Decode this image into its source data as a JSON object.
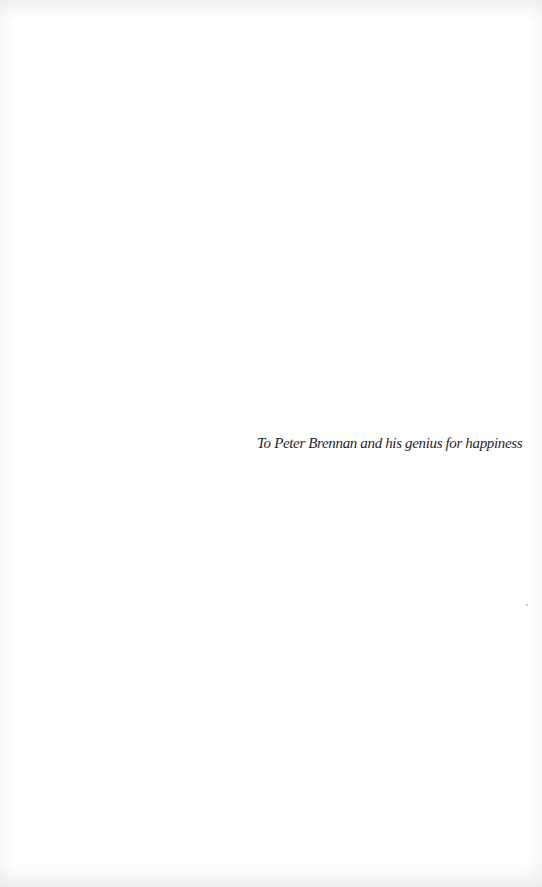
{
  "page": {
    "type": "dedication",
    "dedication_text": "To Peter Brennan and his genius for happiness"
  },
  "colors": {
    "background": "#ffffff",
    "text": "#1f1f1f"
  }
}
